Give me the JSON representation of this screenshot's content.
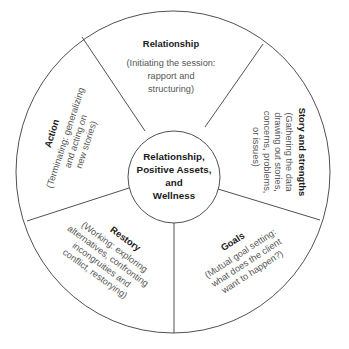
{
  "diagram": {
    "center": {
      "lines": [
        "Relationship,",
        "Positive Assets,",
        "and",
        "Wellness"
      ]
    },
    "segments": [
      {
        "id": "relationship",
        "title": "Relationship",
        "desc": [
          "(Initiating the session:",
          "rapport and",
          "structuring)"
        ]
      },
      {
        "id": "story-and-strengths",
        "title": "Story and strengths",
        "desc": [
          "(Gathering the data",
          "drawing out stories,",
          "concerns, problems,",
          "or issues)"
        ]
      },
      {
        "id": "goals",
        "title": "Goals",
        "desc": [
          "(Mutual goal setting:",
          "what does the client",
          "want to happen?)"
        ]
      },
      {
        "id": "restory",
        "title": "Restory",
        "desc": [
          "(Working: exploring",
          "alternatives, confronting",
          "incongruities and",
          "conflict, restorying)"
        ]
      },
      {
        "id": "action",
        "title": "Action",
        "desc": [
          "(Terminating: generalizing",
          "and acting on",
          "new stories)"
        ]
      }
    ],
    "colors": {
      "line": "#3c3c3c",
      "title_text": "#1a1a1a",
      "desc_text": "#555555",
      "background": "#ffffff"
    }
  }
}
